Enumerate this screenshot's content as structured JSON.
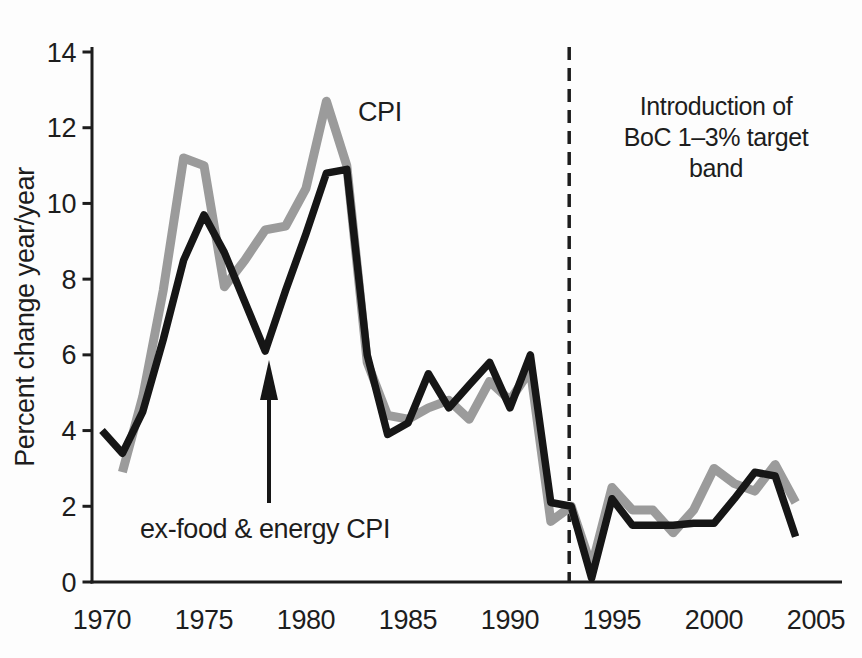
{
  "figure": {
    "background": "#fdfdfd",
    "y_axis_title": "Percent change year/year",
    "cpi_label": "CPI",
    "core_label": "ex-food & energy CPI",
    "annotation_lines": [
      "Introduction of",
      "BoC 1–3% target",
      "band"
    ]
  },
  "chart_data": {
    "type": "line",
    "title": "",
    "xlabel": "",
    "ylabel": "Percent change year/year",
    "xlim": [
      1969.9,
      2006.3
    ],
    "ylim": [
      0,
      14
    ],
    "x_ticks": [
      1970,
      1975,
      1980,
      1985,
      1990,
      1995,
      2000,
      2005
    ],
    "y_ticks": [
      0,
      2,
      4,
      6,
      8,
      10,
      12,
      14
    ],
    "grid": false,
    "legend": "inline-labels",
    "colors": {
      "cpi": "#9b9b9b",
      "core": "#161616",
      "axis": "#1d1d1d"
    },
    "series": [
      {
        "name": "CPI",
        "color": "#9b9b9b",
        "stroke_width": 9,
        "x": [
          1971,
          1972,
          1973,
          1974,
          1975,
          1976,
          1977,
          1978,
          1979,
          1980,
          1981,
          1982,
          1983,
          1984,
          1985,
          1986,
          1987,
          1988,
          1989,
          1990,
          1991,
          1992,
          1993,
          1994,
          1995,
          1996,
          1997,
          1998,
          1999,
          2000,
          2001,
          2002,
          2003,
          2004
        ],
        "values": [
          2.9,
          4.9,
          7.7,
          11.2,
          11.0,
          7.8,
          8.5,
          9.3,
          9.4,
          10.4,
          12.7,
          11.0,
          5.8,
          4.4,
          4.3,
          4.6,
          4.8,
          4.3,
          5.3,
          4.8,
          5.6,
          1.6,
          2.0,
          0.4,
          2.5,
          1.9,
          1.9,
          1.3,
          1.9,
          3.0,
          2.6,
          2.4,
          3.1,
          2.1
        ]
      },
      {
        "name": "ex-food & energy CPI",
        "color": "#161616",
        "stroke_width": 7.5,
        "x": [
          1970,
          1971,
          1972,
          1973,
          1974,
          1975,
          1976,
          1977,
          1978,
          1979,
          1980,
          1981,
          1982,
          1983,
          1984,
          1985,
          1986,
          1987,
          1988,
          1989,
          1990,
          1991,
          1992,
          1993,
          1994,
          1995,
          1996,
          1997,
          1998,
          1999,
          2000,
          2001,
          2002,
          2003,
          2004
        ],
        "values": [
          4.0,
          3.4,
          4.5,
          6.4,
          8.5,
          9.7,
          8.7,
          7.4,
          6.1,
          7.7,
          9.2,
          10.8,
          10.9,
          6.0,
          3.9,
          4.2,
          5.5,
          4.6,
          5.2,
          5.8,
          4.6,
          6.0,
          2.1,
          2.0,
          0.1,
          2.2,
          1.5,
          1.5,
          1.5,
          1.55,
          1.55,
          2.2,
          2.9,
          2.8,
          1.2
        ]
      }
    ],
    "event_line": {
      "year": 1993,
      "style": "dashed",
      "label": "Introduction of BoC 1–3% target band"
    },
    "arrow_annotation": {
      "label": "ex-food & energy CPI",
      "points_to_year": 1978,
      "points_to_value": 6.1
    }
  }
}
